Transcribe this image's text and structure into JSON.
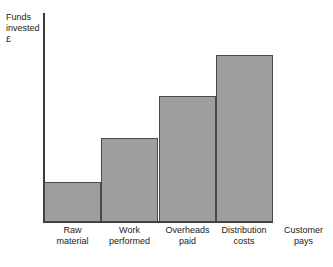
{
  "caption_fragment": "",
  "axes": {
    "y_axis_label": "Funds\ninvested\n£",
    "y_axis_label_lines": [
      "Funds",
      "invested",
      "£"
    ]
  },
  "chart_data": {
    "type": "bar",
    "title": "",
    "xlabel": "",
    "ylabel": "Funds invested £",
    "categories": [
      "Raw\nmaterial",
      "Work\nperformed",
      "Overheads\npaid",
      "Distribution\ncosts"
    ],
    "category_labels_flat": [
      "Raw material",
      "Work performed",
      "Overheads paid",
      "Distribution costs"
    ],
    "values": [
      40,
      84,
      126,
      167
    ],
    "value_units": "px",
    "ylim": [
      0,
      209
    ],
    "grid": false,
    "legend": false,
    "bar_gap": 0,
    "extra_axis_labels": [
      {
        "text": "Customer\npays",
        "text_flat": "Customer pays",
        "position": "right-of-plot"
      }
    ]
  },
  "style": {
    "bar_fill": "#9e9e9e",
    "bar_stroke": "#4a4a4a",
    "axis_color": "#3a3a3a",
    "background": "#ffffff",
    "text_color": "#1a1a1a"
  }
}
